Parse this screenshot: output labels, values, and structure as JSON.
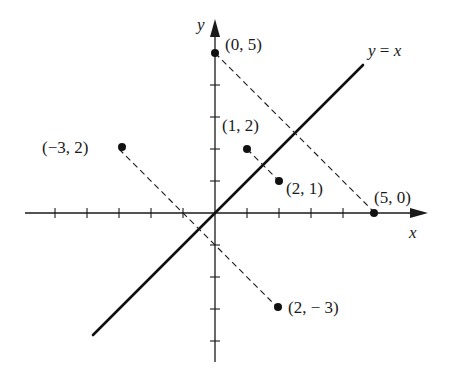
{
  "diagram": {
    "axes": {
      "x_label": "x",
      "y_label": "y",
      "x_ticks": [
        -5,
        -4,
        -3,
        -2,
        -1,
        1,
        2,
        3,
        4
      ],
      "y_ticks": [
        -4,
        -3,
        -2,
        -1,
        1,
        2,
        3,
        4
      ],
      "x_range": [
        -6,
        6.5
      ],
      "y_range": [
        -4.6,
        6
      ]
    },
    "line": {
      "label": "y = x",
      "from": [
        -3.8,
        -3.8
      ],
      "to": [
        4.7,
        4.7
      ]
    },
    "points": [
      {
        "coords": [
          0,
          5
        ],
        "label": "(0, 5)"
      },
      {
        "coords": [
          5,
          0
        ],
        "label": "(5, 0)"
      },
      {
        "coords": [
          1,
          2
        ],
        "label": "(1, 2)"
      },
      {
        "coords": [
          2,
          1
        ],
        "label": "(2, 1)"
      },
      {
        "coords": [
          -3,
          2
        ],
        "label": "(−3, 2)"
      },
      {
        "coords": [
          2,
          -3
        ],
        "label": "(2, − 3)"
      }
    ],
    "reflection_pairs": [
      {
        "from": "(0, 5)",
        "to": "(5, 0)"
      },
      {
        "from": "(1, 2)",
        "to": "(2, 1)"
      },
      {
        "from": "(−3, 2)",
        "to": "(2, − 3)"
      }
    ],
    "colors": {
      "ink": "#1a1a1a",
      "background": "#ffffff"
    }
  }
}
